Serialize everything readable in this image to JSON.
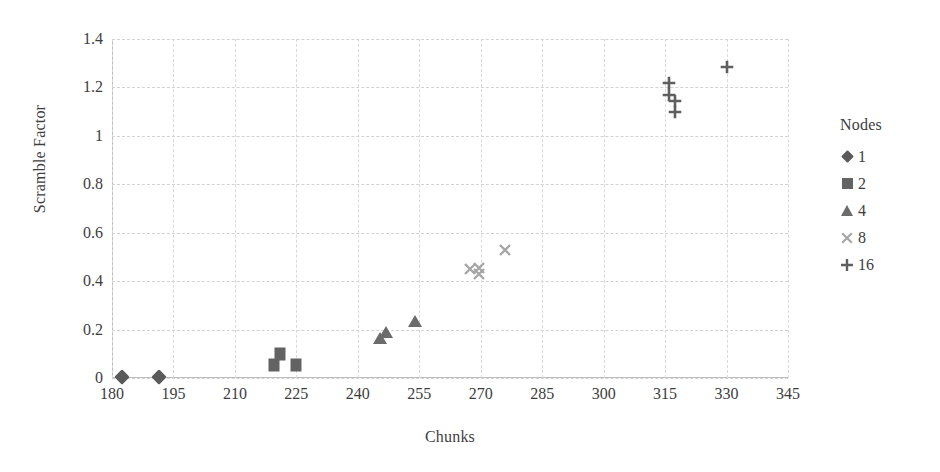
{
  "chart_data": {
    "type": "scatter",
    "title": "",
    "xlabel": "Chunks",
    "ylabel": "Scramble Factor",
    "xlim": [
      180,
      345
    ],
    "ylim": [
      0,
      1.4
    ],
    "xticks": [
      180,
      195,
      210,
      225,
      240,
      255,
      270,
      285,
      300,
      315,
      330,
      345
    ],
    "yticks": [
      "0",
      "0.2",
      "0.4",
      "0.6",
      "0.8",
      "1",
      "1.2",
      "1.4"
    ],
    "grid": true,
    "legend_title": "Nodes",
    "legend_position": "right",
    "series": [
      {
        "name": "1",
        "marker": "diamond",
        "color": "#5a5a5a",
        "points": [
          {
            "x": 182.5,
            "y": 0.005
          },
          {
            "x": 191.5,
            "y": 0.005
          }
        ]
      },
      {
        "name": "2",
        "marker": "square",
        "color": "#636363",
        "points": [
          {
            "x": 219.5,
            "y": 0.055
          },
          {
            "x": 221.0,
            "y": 0.1
          },
          {
            "x": 225.0,
            "y": 0.055
          }
        ]
      },
      {
        "name": "4",
        "marker": "triangle",
        "color": "#6b6b6b",
        "points": [
          {
            "x": 245.5,
            "y": 0.165
          },
          {
            "x": 247.0,
            "y": 0.19
          },
          {
            "x": 254.0,
            "y": 0.235
          }
        ]
      },
      {
        "name": "8",
        "marker": "cross",
        "color": "#a6a6a6",
        "points": [
          {
            "x": 267.5,
            "y": 0.45
          },
          {
            "x": 269.5,
            "y": 0.455
          },
          {
            "x": 269.5,
            "y": 0.43
          },
          {
            "x": 276.0,
            "y": 0.53
          }
        ]
      },
      {
        "name": "16",
        "marker": "plus",
        "color": "#5f5f5f",
        "points": [
          {
            "x": 316.0,
            "y": 1.22
          },
          {
            "x": 316.0,
            "y": 1.17
          },
          {
            "x": 317.5,
            "y": 1.145
          },
          {
            "x": 317.5,
            "y": 1.1
          },
          {
            "x": 330.0,
            "y": 1.285
          }
        ]
      }
    ]
  },
  "legend": {
    "title": "Nodes",
    "items": [
      {
        "label": "1",
        "marker": "diamond-icon"
      },
      {
        "label": "2",
        "marker": "square-icon"
      },
      {
        "label": "4",
        "marker": "triangle-icon"
      },
      {
        "label": "8",
        "marker": "cross-icon"
      },
      {
        "label": "16",
        "marker": "plus-icon"
      }
    ]
  },
  "colors": {
    "series_1": "#5a5a5a",
    "series_2": "#636363",
    "series_4": "#6b6b6b",
    "series_8": "#a6a6a6",
    "series_16": "#5f5f5f",
    "gridline": "#d2d2d2",
    "axis": "#bdbdbd",
    "text": "#3d3d3d",
    "background": "#ffffff"
  }
}
